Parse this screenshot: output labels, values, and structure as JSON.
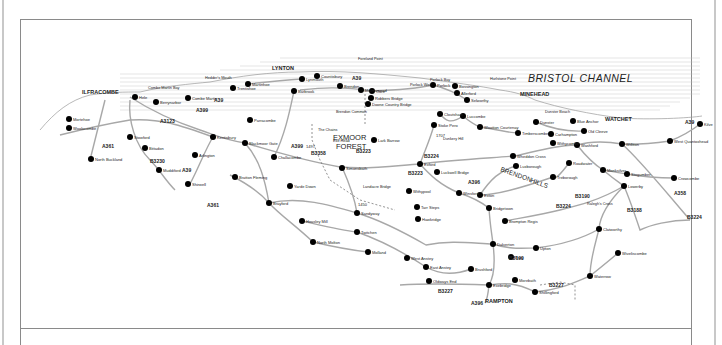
{
  "map": {
    "sea_label": "BRISTOL CHANNEL",
    "region_label": [
      "EXMOOR",
      "FOREST"
    ],
    "hills_label": [
      "BRENDON",
      "HILLS"
    ],
    "headland_labels": [
      {
        "name": "Foreland Point",
        "x": 358,
        "y": 60
      },
      {
        "name": "Hedder's Mouth",
        "x": 205,
        "y": 79
      },
      {
        "name": "Hurlstone Point",
        "x": 490,
        "y": 80
      },
      {
        "name": "Porlock Bay",
        "x": 430,
        "y": 81
      },
      {
        "name": "Dunster Beach",
        "x": 545,
        "y": 113
      },
      {
        "name": "Combe Martin Bay",
        "x": 148,
        "y": 89
      }
    ],
    "major_towns": [
      {
        "name": "ILFRACOMBE",
        "x": 82,
        "y": 94
      },
      {
        "name": "LYNTON",
        "x": 272,
        "y": 70
      },
      {
        "name": "MINEHEAD",
        "x": 520,
        "y": 96
      },
      {
        "name": "WATCHET",
        "x": 605,
        "y": 121
      },
      {
        "name": "RAMPTON",
        "x": 485,
        "y": 303
      }
    ],
    "places": [
      {
        "name": "Hele",
        "x": 135,
        "y": 97
      },
      {
        "name": "Berrynarbor",
        "x": 156,
        "y": 102
      },
      {
        "name": "Combe Martin",
        "x": 188,
        "y": 98
      },
      {
        "name": "Trentishoe",
        "x": 233,
        "y": 88
      },
      {
        "name": "Martinhoe",
        "x": 248,
        "y": 84
      },
      {
        "name": "Lynmouth",
        "x": 302,
        "y": 79
      },
      {
        "name": "Countisbury",
        "x": 317,
        "y": 76
      },
      {
        "name": "Barbrook",
        "x": 294,
        "y": 91
      },
      {
        "name": "Brendon",
        "x": 340,
        "y": 86
      },
      {
        "name": "Malmsmead",
        "x": 361,
        "y": 90
      },
      {
        "name": "Oare",
        "x": 372,
        "y": 91
      },
      {
        "name": "Robbers Bridge",
        "x": 371,
        "y": 98
      },
      {
        "name": "Doone Country Bridge",
        "x": 368,
        "y": 104
      },
      {
        "name": "Porlock",
        "x": 433,
        "y": 85
      },
      {
        "name": "Bossington",
        "x": 455,
        "y": 86
      },
      {
        "name": "Allerford",
        "x": 457,
        "y": 93
      },
      {
        "name": "Selworthy",
        "x": 467,
        "y": 100
      },
      {
        "name": "Luccombe",
        "x": 463,
        "y": 116
      },
      {
        "name": "Cloutsham",
        "x": 440,
        "y": 114
      },
      {
        "name": "Stoke Pero",
        "x": 434,
        "y": 125
      },
      {
        "name": "Wootton Courtenay",
        "x": 480,
        "y": 127
      },
      {
        "name": "Timberscombe",
        "x": 518,
        "y": 133
      },
      {
        "name": "Dunster",
        "x": 536,
        "y": 122
      },
      {
        "name": "Carhampton",
        "x": 551,
        "y": 134
      },
      {
        "name": "Blue Anchor",
        "x": 573,
        "y": 121
      },
      {
        "name": "Old Cleeve",
        "x": 584,
        "y": 131
      },
      {
        "name": "Washford",
        "x": 577,
        "y": 145
      },
      {
        "name": "Withycombe",
        "x": 553,
        "y": 143
      },
      {
        "name": "Williton",
        "x": 622,
        "y": 144
      },
      {
        "name": "West Quantoxhead",
        "x": 670,
        "y": 141
      },
      {
        "name": "Kilve",
        "x": 700,
        "y": 124
      },
      {
        "name": "Roadwater",
        "x": 569,
        "y": 163
      },
      {
        "name": "Luxborough",
        "x": 516,
        "y": 166
      },
      {
        "name": "Treborough",
        "x": 553,
        "y": 177
      },
      {
        "name": "Monksilver",
        "x": 603,
        "y": 170
      },
      {
        "name": "Stogumber",
        "x": 627,
        "y": 174
      },
      {
        "name": "Crowcombe",
        "x": 674,
        "y": 178
      },
      {
        "name": "Lowerby",
        "x": 624,
        "y": 186
      },
      {
        "name": "Wheddon Cross",
        "x": 513,
        "y": 156
      },
      {
        "name": "Exford",
        "x": 420,
        "y": 164
      },
      {
        "name": "Luckwell Bridge",
        "x": 437,
        "y": 172
      },
      {
        "name": "Simonsbath",
        "x": 342,
        "y": 168
      },
      {
        "name": "Lark Barrow",
        "x": 374,
        "y": 140
      },
      {
        "name": "Winsford",
        "x": 459,
        "y": 193
      },
      {
        "name": "Exton",
        "x": 480,
        "y": 195
      },
      {
        "name": "Bridgetown",
        "x": 489,
        "y": 208
      },
      {
        "name": "Brompton Regis",
        "x": 505,
        "y": 221
      },
      {
        "name": "Withypool",
        "x": 409,
        "y": 191
      },
      {
        "name": "Hawkridge",
        "x": 418,
        "y": 219
      },
      {
        "name": "Tarr Steps",
        "x": 417,
        "y": 207
      },
      {
        "name": "Dulverton",
        "x": 493,
        "y": 244
      },
      {
        "name": "Bury",
        "x": 511,
        "y": 257
      },
      {
        "name": "Upton",
        "x": 536,
        "y": 248
      },
      {
        "name": "Clatworthy",
        "x": 599,
        "y": 229
      },
      {
        "name": "Wiveliscombe",
        "x": 618,
        "y": 253
      },
      {
        "name": "Waterrow",
        "x": 590,
        "y": 276
      },
      {
        "name": "Morebath",
        "x": 515,
        "y": 280
      },
      {
        "name": "Shillingford",
        "x": 535,
        "y": 292
      },
      {
        "name": "Exebridge",
        "x": 489,
        "y": 285
      },
      {
        "name": "Brushford",
        "x": 471,
        "y": 269
      },
      {
        "name": "East Anstey",
        "x": 426,
        "y": 267
      },
      {
        "name": "West Anstey",
        "x": 407,
        "y": 258
      },
      {
        "name": "Oldways End",
        "x": 429,
        "y": 281
      },
      {
        "name": "Twitchen",
        "x": 357,
        "y": 232
      },
      {
        "name": "Molland",
        "x": 368,
        "y": 252
      },
      {
        "name": "Sandyway",
        "x": 357,
        "y": 213
      },
      {
        "name": "Heasley Mill",
        "x": 302,
        "y": 221
      },
      {
        "name": "North Molton",
        "x": 313,
        "y": 242
      },
      {
        "name": "Yarde Down",
        "x": 290,
        "y": 186
      },
      {
        "name": "Brayford",
        "x": 269,
        "y": 203
      },
      {
        "name": "Bratton Fleming",
        "x": 235,
        "y": 177
      },
      {
        "name": "Challacombe",
        "x": 274,
        "y": 157
      },
      {
        "name": "Blackmoor Gate",
        "x": 245,
        "y": 143
      },
      {
        "name": "Parracombe",
        "x": 250,
        "y": 120
      },
      {
        "name": "Kentisbury",
        "x": 213,
        "y": 137
      },
      {
        "name": "Arlington",
        "x": 195,
        "y": 155
      },
      {
        "name": "Shirwell",
        "x": 188,
        "y": 184
      },
      {
        "name": "Stowford",
        "x": 130,
        "y": 137
      },
      {
        "name": "Bittadon",
        "x": 145,
        "y": 148
      },
      {
        "name": "Muddiford",
        "x": 159,
        "y": 170
      },
      {
        "name": "Mortehoe",
        "x": 69,
        "y": 119
      },
      {
        "name": "Woolacombe",
        "x": 69,
        "y": 128
      },
      {
        "name": "North Buckland",
        "x": 91,
        "y": 159
      }
    ],
    "roads": [
      {
        "name": "A39",
        "x": 352,
        "y": 80
      },
      {
        "name": "A39",
        "x": 685,
        "y": 124
      },
      {
        "name": "A399",
        "x": 196,
        "y": 112
      },
      {
        "name": "A39",
        "x": 214,
        "y": 102
      },
      {
        "name": "A3123",
        "x": 160,
        "y": 123
      },
      {
        "name": "A361",
        "x": 102,
        "y": 148
      },
      {
        "name": "B3230",
        "x": 150,
        "y": 163
      },
      {
        "name": "A39",
        "x": 182,
        "y": 172
      },
      {
        "name": "B3358",
        "x": 311,
        "y": 155
      },
      {
        "name": "B3223",
        "x": 356,
        "y": 153
      },
      {
        "name": "B3224",
        "x": 424,
        "y": 158
      },
      {
        "name": "B3223",
        "x": 408,
        "y": 175
      },
      {
        "name": "B3224",
        "x": 556,
        "y": 208
      },
      {
        "name": "A396",
        "x": 468,
        "y": 184
      },
      {
        "name": "B3190",
        "x": 575,
        "y": 198
      },
      {
        "name": "B3188",
        "x": 627,
        "y": 212
      },
      {
        "name": "A358",
        "x": 674,
        "y": 195
      },
      {
        "name": "B3224",
        "x": 687,
        "y": 219
      },
      {
        "name": "B3190",
        "x": 509,
        "y": 260
      },
      {
        "name": "A396",
        "x": 471,
        "y": 305
      },
      {
        "name": "B3227",
        "x": 438,
        "y": 293
      },
      {
        "name": "B3227",
        "x": 549,
        "y": 287
      },
      {
        "name": "A361",
        "x": 207,
        "y": 207
      },
      {
        "name": "A399",
        "x": 291,
        "y": 148
      }
    ],
    "elevations": [
      {
        "value": "1450",
        "x": 358,
        "y": 206
      },
      {
        "value": "1497",
        "x": 306,
        "y": 148
      },
      {
        "value": "1707",
        "x": 436,
        "y": 137
      }
    ],
    "misc_labels": [
      {
        "name": "The Chains",
        "x": 318,
        "y": 131
      },
      {
        "name": "Exe Head",
        "x": 333,
        "y": 142
      },
      {
        "name": "Dunkery Hill",
        "x": 443,
        "y": 140
      },
      {
        "name": "Brendon Common",
        "x": 336,
        "y": 113
      },
      {
        "name": "Landacre Bridge",
        "x": 363,
        "y": 188
      },
      {
        "name": "Ralegh's Cross",
        "x": 587,
        "y": 205
      },
      {
        "name": "Porlock Weir",
        "x": 410,
        "y": 86
      }
    ]
  },
  "colors": {
    "road": "#a8a8a8",
    "town_dot": "#000000",
    "frame": "#8a8a8a",
    "outer_border": "#c8c8c8",
    "sea_lines": "#bdbdbd"
  }
}
